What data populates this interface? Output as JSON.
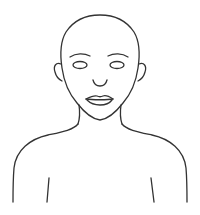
{
  "figure": {
    "subject": "face-outline-bust",
    "style": "line-drawing",
    "colors": {
      "background": "#ffffff",
      "stroke": "#333333"
    }
  }
}
